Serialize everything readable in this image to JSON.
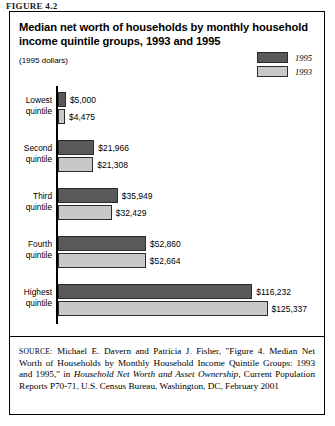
{
  "figure_caption": "FIGURE 4.2",
  "chart": {
    "title": "Median net worth of households by monthly household income quintile groups, 1993 and 1995",
    "subtitle": "(1995 dollars)",
    "legend": [
      {
        "label": "1995",
        "color": "#595959"
      },
      {
        "label": "1993",
        "color": "#c8c8c8"
      }
    ]
  },
  "source": {
    "kicker": "SOURCE:",
    "text_before_italic": " Michael E. Davern and Patricia J. Fisher, \"Figure 4. Median Net Worth of Households by Monthly Household Income Quintile Groups: 1993 and 1995,\" in ",
    "italic_title": "Household Net Worth and Asset Ownership",
    "text_after_italic": ", Current Population Reports P70-71, U.S. Census Bureau, Washington, DC, February 2001"
  },
  "chart_data": {
    "type": "bar",
    "orientation": "horizontal",
    "title": "Median net worth of households by monthly household income quintile groups, 1993 and 1995",
    "subtitle": "(1995 dollars)",
    "xlabel": "",
    "ylabel": "",
    "categories": [
      "Lowest quintile",
      "Second quintile",
      "Third quintile",
      "Fourth quintile",
      "Highest quintile"
    ],
    "series": [
      {
        "name": "1995",
        "color": "#595959",
        "values": [
          5000,
          21966,
          35949,
          52860,
          116232
        ],
        "labels": [
          "$5,000",
          "$21,966",
          "$35,949",
          "$52,860",
          "$116,232"
        ]
      },
      {
        "name": "1993",
        "color": "#c8c8c8",
        "values": [
          4475,
          21308,
          32429,
          52664,
          125337
        ],
        "labels": [
          "$4,475",
          "$21,308",
          "$32,429",
          "$52,664",
          "$125,337"
        ]
      }
    ],
    "xlim": [
      0,
      125337
    ],
    "grid": false,
    "legend_position": "top-right"
  }
}
